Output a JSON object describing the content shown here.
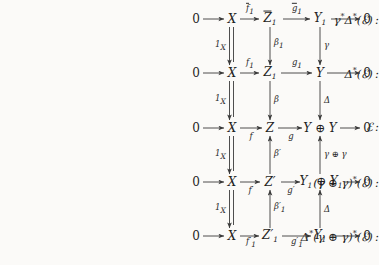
{
  "figure": {
    "kind": "commutative-diagram",
    "background_color": "#fbfaf8",
    "ink_color": "#2b2b2b"
  },
  "row_labels": [
    {
      "id": "row-1-label",
      "text": "γ*Δ*(ℰ) :"
    },
    {
      "id": "row-2-label",
      "text": "Δ*(ℰ) :"
    },
    {
      "id": "row-3-label",
      "text": "ℰ :"
    },
    {
      "id": "row-4-label",
      "text": "(γ ⊕ γ)*(ℰ) :"
    },
    {
      "id": "row-5-label",
      "text": "Δ*(γ ⊕ γ)*(ℰ) :"
    }
  ],
  "rows": [
    {
      "id": "row-1",
      "nodes": [
        "0",
        "X",
        "Z̅1",
        "Y1",
        "0"
      ],
      "node_display": [
        {
          "text": "0",
          "style": "upright"
        },
        {
          "text": "X",
          "style": "italic"
        },
        {
          "text": "Z̅",
          "sub": "1",
          "style": "italic-bar"
        },
        {
          "text": "Y",
          "sub": "1",
          "style": "italic"
        },
        {
          "text": "0",
          "style": "upright"
        }
      ],
      "arrow_labels": [
        "",
        "f̅₁",
        "g̅₁",
        ""
      ]
    },
    {
      "id": "row-2",
      "nodes": [
        "0",
        "X",
        "Z1",
        "Y",
        "0"
      ],
      "node_display": [
        {
          "text": "0",
          "style": "upright"
        },
        {
          "text": "X",
          "style": "italic"
        },
        {
          "text": "Z",
          "sub": "1",
          "style": "italic"
        },
        {
          "text": "Y",
          "sub": "",
          "style": "italic"
        },
        {
          "text": "0",
          "style": "upright"
        }
      ],
      "arrow_labels": [
        "",
        "f₁",
        "g₁",
        ""
      ]
    },
    {
      "id": "row-3",
      "nodes": [
        "0",
        "X",
        "Z",
        "Y ⊕ Y",
        "0"
      ],
      "node_display": [
        {
          "text": "0",
          "style": "upright"
        },
        {
          "text": "X",
          "style": "italic"
        },
        {
          "text": "Z",
          "sub": "",
          "style": "italic"
        },
        {
          "text": "Y ⊕ Y",
          "sub": "",
          "style": "italic"
        },
        {
          "text": "0",
          "style": "upright"
        }
      ],
      "arrow_labels": [
        "",
        "f",
        "g",
        ""
      ]
    },
    {
      "id": "row-4",
      "nodes": [
        "0",
        "X",
        "Z′",
        "Y1 ⊕ Y1",
        "0"
      ],
      "node_display": [
        {
          "text": "0",
          "style": "upright"
        },
        {
          "text": "X",
          "style": "italic"
        },
        {
          "text": "Z′",
          "sub": "",
          "style": "italic"
        },
        {
          "text": "Y₁ ⊕ Y₁",
          "sub": "",
          "style": "italic"
        },
        {
          "text": "0",
          "style": "upright"
        }
      ],
      "arrow_labels": [
        "",
        "f′",
        "g′",
        ""
      ]
    },
    {
      "id": "row-5",
      "nodes": [
        "0",
        "X",
        "Z′₁",
        "Y1",
        "0"
      ],
      "node_display": [
        {
          "text": "0",
          "style": "upright"
        },
        {
          "text": "X",
          "style": "italic"
        },
        {
          "text": "Z′",
          "sub": "1",
          "style": "italic"
        },
        {
          "text": "Y",
          "sub": "1",
          "style": "italic"
        },
        {
          "text": "0",
          "style": "upright"
        }
      ],
      "arrow_labels": [
        "",
        "f′₁",
        "g′₁",
        ""
      ]
    }
  ],
  "vertical_maps": {
    "column_x": [
      {
        "id": "v-x-1",
        "label": "1X",
        "direction": "down",
        "style": "double-equals"
      },
      {
        "id": "v-x-2",
        "label": "1X",
        "direction": "down",
        "style": "double-equals"
      },
      {
        "id": "v-x-3",
        "label": "1X",
        "direction": "down",
        "style": "double-equals"
      },
      {
        "id": "v-x-4",
        "label": "1X",
        "direction": "down",
        "style": "double-equals"
      }
    ],
    "column_z": [
      {
        "id": "v-z-1",
        "label": "β₁",
        "direction": "down"
      },
      {
        "id": "v-z-2",
        "label": "β",
        "direction": "down"
      },
      {
        "id": "v-z-3",
        "label": "β′",
        "direction": "up"
      },
      {
        "id": "v-z-4",
        "label": "β′₁",
        "direction": "up"
      }
    ],
    "column_y": [
      {
        "id": "v-y-1",
        "label": "γ",
        "direction": "down"
      },
      {
        "id": "v-y-2",
        "label": "Δ",
        "direction": "down"
      },
      {
        "id": "v-y-3",
        "label": "γ ⊕ γ",
        "direction": "up"
      },
      {
        "id": "v-y-4",
        "label": "Δ",
        "direction": "up"
      }
    ]
  },
  "axis_x_positions": {
    "zero_left": 196,
    "x": 232,
    "z": 270,
    "y": 320,
    "zero_right": 367
  },
  "row_y_positions": [
    19,
    73,
    128,
    182,
    236
  ]
}
